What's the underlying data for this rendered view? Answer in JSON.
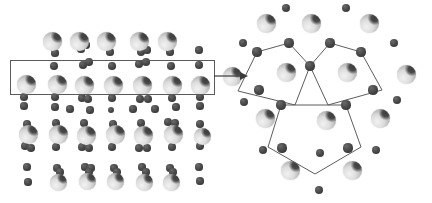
{
  "figure": {
    "background_color": "#ffffff",
    "width": 432,
    "height": 203
  },
  "legend": {
    "large_atom_name": "large-atom",
    "large_atom_color": "#c8c8c8",
    "small_atom_name": "small-atom",
    "small_atom_color": "#3a3a3a",
    "outline_color": "#5d5d5d"
  },
  "panels": [
    {
      "id": "left",
      "name": "lattice-overview-panel",
      "description": "Periodic lattice of large and small atoms with a highlighted row"
    },
    {
      "id": "right",
      "name": "pentagon-detail-panel",
      "description": "Enlarged lattice region with three interlocking pentagons outlined"
    }
  ],
  "annotations": {
    "selection_rect": {
      "x": 10,
      "y": 60,
      "width": 203,
      "height": 33
    },
    "arrow": {
      "x1": 214,
      "y1": 76,
      "x2": 248,
      "y2": 76
    },
    "pentagon_count": 3
  },
  "left_panel": {
    "large_atoms": [
      {
        "x": 52,
        "y": 41,
        "r": 9.5
      },
      {
        "x": 79,
        "y": 41,
        "r": 9.5
      },
      {
        "x": 106,
        "y": 41,
        "r": 9.5
      },
      {
        "x": 139,
        "y": 41,
        "r": 9.5
      },
      {
        "x": 167,
        "y": 41,
        "r": 9.5
      },
      {
        "x": 26,
        "y": 84,
        "r": 9.5
      },
      {
        "x": 57,
        "y": 84,
        "r": 9.5
      },
      {
        "x": 84,
        "y": 85,
        "r": 9.5
      },
      {
        "x": 113,
        "y": 85,
        "r": 9.5
      },
      {
        "x": 142,
        "y": 85,
        "r": 9.5
      },
      {
        "x": 172,
        "y": 85,
        "r": 9.5
      },
      {
        "x": 200,
        "y": 85,
        "r": 9.5
      },
      {
        "x": 28,
        "y": 134,
        "r": 9.5
      },
      {
        "x": 58,
        "y": 134,
        "r": 9.5
      },
      {
        "x": 86,
        "y": 135,
        "r": 9.5
      },
      {
        "x": 115,
        "y": 134,
        "r": 9.5
      },
      {
        "x": 143,
        "y": 135,
        "r": 9.5
      },
      {
        "x": 173,
        "y": 134,
        "r": 9.5
      },
      {
        "x": 202,
        "y": 136,
        "r": 8.5
      },
      {
        "x": 58,
        "y": 182,
        "r": 8.5
      },
      {
        "x": 87,
        "y": 181,
        "r": 8.5
      },
      {
        "x": 115,
        "y": 181,
        "r": 8.5
      },
      {
        "x": 144,
        "y": 182,
        "r": 8.5
      },
      {
        "x": 171,
        "y": 182,
        "r": 8.5
      }
    ],
    "small_atoms": [
      {
        "x": 55,
        "y": 53,
        "r": 3.6
      },
      {
        "x": 81,
        "y": 49,
        "r": 3.6
      },
      {
        "x": 86,
        "y": 45,
        "r": 3.6
      },
      {
        "x": 110,
        "y": 52,
        "r": 3.6
      },
      {
        "x": 141,
        "y": 52,
        "r": 4.2
      },
      {
        "x": 147,
        "y": 50,
        "r": 3.6
      },
      {
        "x": 170,
        "y": 52,
        "r": 3.6
      },
      {
        "x": 199,
        "y": 50,
        "r": 3.6
      },
      {
        "x": 54,
        "y": 66,
        "r": 3.8
      },
      {
        "x": 83,
        "y": 65,
        "r": 3.8
      },
      {
        "x": 89,
        "y": 62,
        "r": 3.8
      },
      {
        "x": 112,
        "y": 66,
        "r": 3.8
      },
      {
        "x": 139,
        "y": 64,
        "r": 3.8
      },
      {
        "x": 146,
        "y": 62,
        "r": 3.8
      },
      {
        "x": 171,
        "y": 66,
        "r": 3.8
      },
      {
        "x": 199,
        "y": 65,
        "r": 3.8
      },
      {
        "x": 24,
        "y": 97,
        "r": 3.8
      },
      {
        "x": 55,
        "y": 97,
        "r": 3.8
      },
      {
        "x": 82,
        "y": 98,
        "r": 3.8
      },
      {
        "x": 88,
        "y": 99,
        "r": 3.8
      },
      {
        "x": 112,
        "y": 98,
        "r": 3.8
      },
      {
        "x": 140,
        "y": 99,
        "r": 3.8
      },
      {
        "x": 148,
        "y": 99,
        "r": 3.8
      },
      {
        "x": 172,
        "y": 98,
        "r": 3.8
      },
      {
        "x": 200,
        "y": 97,
        "r": 3.8
      },
      {
        "x": 24,
        "y": 106,
        "r": 3.6
      },
      {
        "x": 55,
        "y": 107,
        "r": 3.6
      },
      {
        "x": 70,
        "y": 109,
        "r": 3.6
      },
      {
        "x": 90,
        "y": 110,
        "r": 3.6
      },
      {
        "x": 111,
        "y": 110,
        "r": 3.4
      },
      {
        "x": 133,
        "y": 109,
        "r": 3.6
      },
      {
        "x": 155,
        "y": 109,
        "r": 3.6
      },
      {
        "x": 176,
        "y": 107,
        "r": 3.6
      },
      {
        "x": 200,
        "y": 106,
        "r": 3.6
      },
      {
        "x": 27,
        "y": 124,
        "r": 3.8
      },
      {
        "x": 56,
        "y": 123,
        "r": 3.8
      },
      {
        "x": 84,
        "y": 123,
        "r": 3.8
      },
      {
        "x": 113,
        "y": 124,
        "r": 3.8
      },
      {
        "x": 141,
        "y": 123,
        "r": 3.8
      },
      {
        "x": 168,
        "y": 122,
        "r": 3.8
      },
      {
        "x": 175,
        "y": 123,
        "r": 3.8
      },
      {
        "x": 200,
        "y": 124,
        "r": 3.8
      },
      {
        "x": 25,
        "y": 146,
        "r": 3.8
      },
      {
        "x": 31,
        "y": 148,
        "r": 3.8
      },
      {
        "x": 56,
        "y": 147,
        "r": 3.8
      },
      {
        "x": 82,
        "y": 147,
        "r": 3.8
      },
      {
        "x": 89,
        "y": 148,
        "r": 3.8
      },
      {
        "x": 112,
        "y": 147,
        "r": 3.8
      },
      {
        "x": 139,
        "y": 148,
        "r": 3.8
      },
      {
        "x": 147,
        "y": 148,
        "r": 3.8
      },
      {
        "x": 172,
        "y": 147,
        "r": 3.8
      },
      {
        "x": 200,
        "y": 146,
        "r": 3.8
      },
      {
        "x": 27,
        "y": 167,
        "r": 3.6
      },
      {
        "x": 57,
        "y": 168,
        "r": 3.6
      },
      {
        "x": 85,
        "y": 167,
        "r": 3.6
      },
      {
        "x": 91,
        "y": 168,
        "r": 3.6
      },
      {
        "x": 114,
        "y": 168,
        "r": 3.6
      },
      {
        "x": 142,
        "y": 167,
        "r": 3.6
      },
      {
        "x": 170,
        "y": 168,
        "r": 3.6
      },
      {
        "x": 199,
        "y": 167,
        "r": 3.6
      },
      {
        "x": 28,
        "y": 182,
        "r": 3.6
      },
      {
        "x": 60,
        "y": 172,
        "r": 3.8
      },
      {
        "x": 89,
        "y": 172,
        "r": 3.8
      },
      {
        "x": 117,
        "y": 172,
        "r": 3.8
      },
      {
        "x": 146,
        "y": 172,
        "r": 3.8
      },
      {
        "x": 173,
        "y": 172,
        "r": 3.8
      },
      {
        "x": 200,
        "y": 181,
        "r": 3.6
      }
    ]
  },
  "right_panel": {
    "large_atoms": [
      {
        "x": 50,
        "y": 23,
        "r": 9.5
      },
      {
        "x": 95,
        "y": 23,
        "r": 9.5
      },
      {
        "x": 153,
        "y": 23,
        "r": 9.5
      },
      {
        "x": 16,
        "y": 76,
        "r": 9.5
      },
      {
        "x": 70,
        "y": 72,
        "r": 9.5
      },
      {
        "x": 131,
        "y": 72,
        "r": 9.5
      },
      {
        "x": 190,
        "y": 74,
        "r": 9.5
      },
      {
        "x": 49,
        "y": 118,
        "r": 9.5
      },
      {
        "x": 110,
        "y": 120,
        "r": 9.5
      },
      {
        "x": 164,
        "y": 118,
        "r": 9.5
      },
      {
        "x": 74,
        "y": 170,
        "r": 9.5
      },
      {
        "x": 136,
        "y": 170,
        "r": 9.5
      }
    ],
    "small_atoms": [
      {
        "x": 70,
        "y": 8,
        "r": 4.2
      },
      {
        "x": 130,
        "y": 8,
        "r": 4.2
      },
      {
        "x": 27,
        "y": 43,
        "r": 4.2
      },
      {
        "x": 178,
        "y": 43,
        "r": 4.2
      },
      {
        "x": 28,
        "y": 102,
        "r": 4.2
      },
      {
        "x": 181,
        "y": 100,
        "r": 4.2
      },
      {
        "x": 47,
        "y": 150,
        "r": 4.2
      },
      {
        "x": 104,
        "y": 153,
        "r": 4.2
      },
      {
        "x": 160,
        "y": 150,
        "r": 4.2
      },
      {
        "x": 103,
        "y": 190,
        "r": 4.2
      }
    ],
    "vertex_atoms": [
      {
        "x": 41,
        "y": 52,
        "r": 4.6
      },
      {
        "x": 73,
        "y": 43,
        "r": 4.6
      },
      {
        "x": 114,
        "y": 43,
        "r": 4.6
      },
      {
        "x": 145,
        "y": 52,
        "r": 4.6
      },
      {
        "x": 43,
        "y": 90,
        "r": 4.6
      },
      {
        "x": 94,
        "y": 66,
        "r": 4.6
      },
      {
        "x": 157,
        "y": 90,
        "r": 4.6
      },
      {
        "x": 65,
        "y": 105,
        "r": 4.6
      },
      {
        "x": 130,
        "y": 105,
        "r": 4.6
      },
      {
        "x": 66,
        "y": 148,
        "r": 4.6
      },
      {
        "x": 132,
        "y": 148,
        "r": 4.6
      }
    ],
    "pentagons": [
      {
        "name": "pentagon-left",
        "points": "41,52 73,43 94,66 79,105 22,91"
      },
      {
        "name": "pentagon-right",
        "points": "114,43 145,52 166,90 112,105 94,66"
      },
      {
        "name": "pentagon-bottom",
        "points": "65,105 130,105 145,147 99,174 52,147"
      }
    ]
  }
}
